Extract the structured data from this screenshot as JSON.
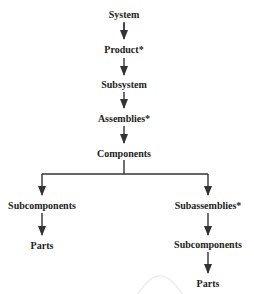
{
  "diagram": {
    "type": "hierarchy",
    "nodes": {
      "system": "System",
      "product": "Product*",
      "subsystem": "Subsystem",
      "assemblies": "Assemblies*",
      "components": "Components",
      "left_subcomponents": "Subcomponents",
      "left_parts": "Parts",
      "subassemblies": "Subassemblies*",
      "right_subcomponents": "Subcomponents",
      "right_parts": "Parts"
    },
    "edges": [
      [
        "System",
        "Product*"
      ],
      [
        "Product*",
        "Subsystem"
      ],
      [
        "Subsystem",
        "Assemblies*"
      ],
      [
        "Assemblies*",
        "Components"
      ],
      [
        "Components",
        "Subcomponents"
      ],
      [
        "Components",
        "Subassemblies*"
      ],
      [
        "Subcomponents",
        "Parts"
      ],
      [
        "Subassemblies*",
        "Subcomponents"
      ],
      [
        "Subcomponents",
        "Parts"
      ]
    ],
    "line_color": "#333333"
  }
}
